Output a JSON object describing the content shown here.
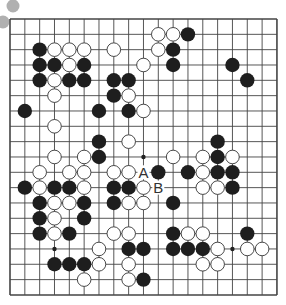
{
  "board": {
    "size": 19,
    "origin": {
      "x": 10,
      "y": 19
    },
    "spacing": {
      "x": 14.83,
      "y": 15.33
    },
    "line_color": "#444444",
    "black_color": "#1e1e1e",
    "white_fill": "#ffffff",
    "white_stroke": "#333333",
    "stone_radius": 7.2,
    "star_points": [
      [
        9,
        9
      ],
      [
        3,
        15
      ],
      [
        15,
        15
      ]
    ]
  },
  "decor": {
    "gray_dots": [
      {
        "x": 13,
        "y": 6,
        "r": 6.5,
        "color": "#b0b0b0"
      },
      {
        "x": 3,
        "y": 22,
        "r": 6.5,
        "color": "#b0b0b0"
      }
    ]
  },
  "stones": {
    "black": [
      [
        12,
        1
      ],
      [
        2,
        2
      ],
      [
        11,
        2
      ],
      [
        2,
        3
      ],
      [
        3,
        3
      ],
      [
        5,
        3
      ],
      [
        11,
        3
      ],
      [
        15,
        3
      ],
      [
        2,
        4
      ],
      [
        4,
        4
      ],
      [
        5,
        4
      ],
      [
        7,
        4
      ],
      [
        8,
        4
      ],
      [
        16,
        4
      ],
      [
        7,
        5
      ],
      [
        1,
        6
      ],
      [
        6,
        6
      ],
      [
        8,
        6
      ],
      [
        6,
        8
      ],
      [
        14,
        8
      ],
      [
        6,
        9
      ],
      [
        14,
        9
      ],
      [
        10,
        10
      ],
      [
        12,
        10
      ],
      [
        14,
        10
      ],
      [
        15,
        10
      ],
      [
        1,
        11
      ],
      [
        3,
        11
      ],
      [
        4,
        11
      ],
      [
        7,
        11
      ],
      [
        8,
        11
      ],
      [
        15,
        11
      ],
      [
        2,
        12
      ],
      [
        5,
        12
      ],
      [
        7,
        12
      ],
      [
        11,
        12
      ],
      [
        2,
        13
      ],
      [
        5,
        13
      ],
      [
        2,
        14
      ],
      [
        4,
        14
      ],
      [
        11,
        14
      ],
      [
        16,
        14
      ],
      [
        8,
        15
      ],
      [
        9,
        15
      ],
      [
        11,
        15
      ],
      [
        12,
        15
      ],
      [
        13,
        15
      ],
      [
        3,
        16
      ],
      [
        4,
        16
      ],
      [
        5,
        16
      ],
      [
        9,
        17
      ]
    ],
    "white": [
      [
        10,
        1
      ],
      [
        11,
        1
      ],
      [
        3,
        2
      ],
      [
        4,
        2
      ],
      [
        5,
        2
      ],
      [
        7,
        2
      ],
      [
        10,
        2
      ],
      [
        4,
        3
      ],
      [
        9,
        3
      ],
      [
        3,
        4
      ],
      [
        3,
        5
      ],
      [
        8,
        5
      ],
      [
        9,
        6
      ],
      [
        3,
        7
      ],
      [
        8,
        8
      ],
      [
        3,
        9
      ],
      [
        5,
        9
      ],
      [
        11,
        9
      ],
      [
        13,
        9
      ],
      [
        15,
        9
      ],
      [
        2,
        10
      ],
      [
        4,
        10
      ],
      [
        5,
        10
      ],
      [
        7,
        10
      ],
      [
        8,
        10
      ],
      [
        13,
        10
      ],
      [
        2,
        11
      ],
      [
        5,
        11
      ],
      [
        9,
        11
      ],
      [
        13,
        11
      ],
      [
        14,
        11
      ],
      [
        3,
        12
      ],
      [
        4,
        12
      ],
      [
        8,
        12
      ],
      [
        9,
        12
      ],
      [
        3,
        13
      ],
      [
        3,
        14
      ],
      [
        7,
        14
      ],
      [
        8,
        14
      ],
      [
        12,
        14
      ],
      [
        13,
        14
      ],
      [
        6,
        15
      ],
      [
        14,
        15
      ],
      [
        16,
        15
      ],
      [
        17,
        15
      ],
      [
        6,
        16
      ],
      [
        8,
        16
      ],
      [
        13,
        16
      ],
      [
        14,
        16
      ],
      [
        5,
        17
      ],
      [
        8,
        17
      ]
    ]
  },
  "labels": [
    {
      "text": "A",
      "col": 9,
      "row": 10
    },
    {
      "text": "B",
      "col": 10,
      "row": 11
    }
  ]
}
